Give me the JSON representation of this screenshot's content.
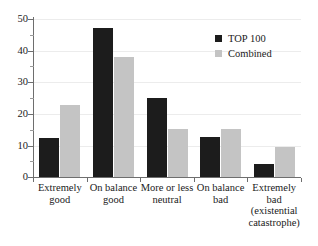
{
  "chart_data": {
    "type": "bar",
    "title": "",
    "subtitle": "",
    "xlabel": "",
    "ylabel": "",
    "ylim": [
      0,
      50
    ],
    "yticks": [
      0,
      10,
      20,
      30,
      40,
      50
    ],
    "ytick_labels": [
      "0",
      "10",
      "20",
      "30",
      "40",
      "50"
    ],
    "yticks_minor": [
      5,
      15,
      25,
      35,
      45
    ],
    "grid": true,
    "legend_position": "top-right",
    "categories": [
      "Extremely good",
      "On balance good",
      "More or less neutral",
      "On balance bad",
      "Extremely bad (existential catastrophe)"
    ],
    "category_label_lines": [
      [
        "Extremely",
        "good"
      ],
      [
        "On balance",
        "good"
      ],
      [
        "More or less",
        "neutral"
      ],
      [
        "On balance",
        "bad"
      ],
      [
        "Extremely",
        "bad",
        "(existential",
        "catastrophe)"
      ]
    ],
    "series": [
      {
        "name": "TOP 100",
        "color": "#1c1c1c",
        "values": [
          12.5,
          47.0,
          25.0,
          12.7,
          4.1
        ]
      },
      {
        "name": "Combined",
        "color": "#c4c4c4",
        "values": [
          22.8,
          38.0,
          15.2,
          15.2,
          9.4
        ]
      }
    ]
  },
  "legend": {
    "items": [
      {
        "label": "TOP 100",
        "swatch": "top100"
      },
      {
        "label": "Combined",
        "swatch": "combined"
      }
    ]
  },
  "axis": {
    "y_labels": [
      "50",
      "40",
      "30",
      "20",
      "10",
      "0"
    ]
  }
}
